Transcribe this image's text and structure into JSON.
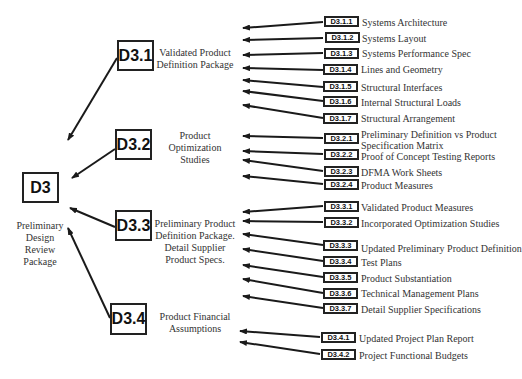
{
  "root": {
    "id": "D3",
    "description": [
      "Preliminary",
      "Design",
      "Review",
      "Package"
    ]
  },
  "groups": [
    {
      "id": "D3.1",
      "description": [
        "Validated Product",
        "Definition Package"
      ],
      "items": [
        {
          "id": "D3.1.1",
          "label": "Systems Architecture"
        },
        {
          "id": "D3.1.2",
          "label": "Systems Layout"
        },
        {
          "id": "D3.1.3",
          "label": "Systems Performance Spec"
        },
        {
          "id": "D3.1.4",
          "label": "Lines and Geometry"
        },
        {
          "id": "D3.1.5",
          "label": "Structural Interfaces"
        },
        {
          "id": "D3.1.6",
          "label": "Internal Structural Loads"
        },
        {
          "id": "D3.1.7",
          "label": "Structural Arrangement"
        }
      ]
    },
    {
      "id": "D3.2",
      "description": [
        "Product",
        "Optimization",
        "Studies"
      ],
      "items": [
        {
          "id": "D3.2.1",
          "label": "Preliminary Definition vs Product",
          "label2": "Specification Matrix"
        },
        {
          "id": "D3.2.2",
          "label": "Proof of Concept Testing Reports"
        },
        {
          "id": "D3.2.3",
          "label": "DFMA Work Sheets"
        },
        {
          "id": "D3.2.4",
          "label": "Product Measures"
        }
      ]
    },
    {
      "id": "D3.3",
      "description": [
        "Preliminary Product",
        "Definition Package.",
        "Detail Supplier",
        "Product Specs."
      ],
      "items": [
        {
          "id": "D3.3.1",
          "label": "Validated Product Measures"
        },
        {
          "id": "D3.3.2",
          "label": "Incorporated Optimization Studies"
        },
        {
          "id": "D3.3.3",
          "label": "Updated Preliminary Product Definition"
        },
        {
          "id": "D3.3.4",
          "label": "Test Plans"
        },
        {
          "id": "D3.3.5",
          "label": "Product Substantiation"
        },
        {
          "id": "D3.3.6",
          "label": "Technical Management Plans"
        },
        {
          "id": "D3.3.7",
          "label": "Detail Supplier Specifications"
        }
      ]
    },
    {
      "id": "D3.4",
      "description": [
        "Product Financial",
        "Assumptions"
      ],
      "items": [
        {
          "id": "D3.4.1",
          "label": "Updated Project Plan Report"
        },
        {
          "id": "D3.4.2",
          "label": "Project Functional Budgets"
        }
      ]
    }
  ],
  "colors": {
    "line": "#1a1a1a",
    "text": "#333333",
    "box_border": "#222222"
  }
}
